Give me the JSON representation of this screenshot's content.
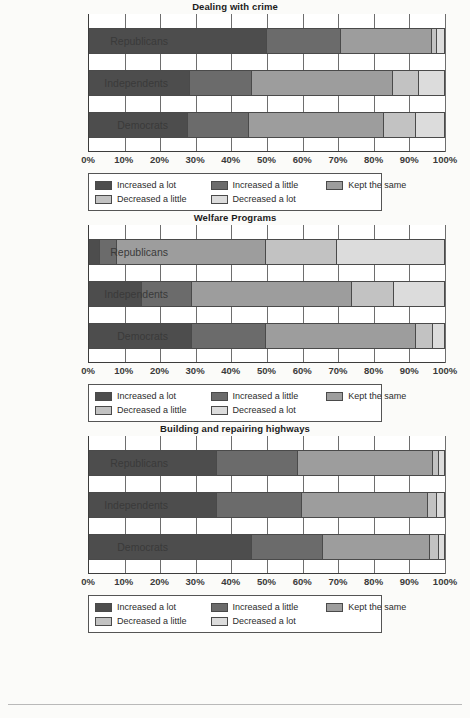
{
  "chart_data": [
    {
      "type": "bar",
      "subtype": "stacked-horizontal-100pct",
      "title": "Dealing with crime",
      "xlabel": "",
      "ylabel": "",
      "xlim": [
        0,
        100
      ],
      "xticks": [
        "0%",
        "10%",
        "20%",
        "30%",
        "40%",
        "50%",
        "60%",
        "70%",
        "80%",
        "90%",
        "100%"
      ],
      "grid": true,
      "legend_position": "bottom",
      "categories": [
        "Republicans",
        "Independents",
        "Democrats"
      ],
      "series": [
        {
          "name": "Increased a lot",
          "color": "#4d4d4d",
          "values": [
            50.0,
            28.5,
            28.0
          ]
        },
        {
          "name": "Increased a little",
          "color": "#6b6b6b",
          "values": [
            21.0,
            17.5,
            17.0
          ]
        },
        {
          "name": "Kept the same",
          "color": "#9d9d9d",
          "values": [
            25.5,
            39.5,
            38.0
          ]
        },
        {
          "name": "Decreased a little",
          "color": "#c2c2c2",
          "values": [
            1.5,
            7.5,
            9.0
          ]
        },
        {
          "name": "Decreased a lot",
          "color": "#dcdcdc",
          "values": [
            2.0,
            7.0,
            8.0
          ]
        }
      ]
    },
    {
      "type": "bar",
      "subtype": "stacked-horizontal-100pct",
      "title": "Welfare Programs",
      "xlabel": "",
      "ylabel": "",
      "xlim": [
        0,
        100
      ],
      "xticks": [
        "0%",
        "10%",
        "20%",
        "30%",
        "40%",
        "50%",
        "60%",
        "70%",
        "80%",
        "90%",
        "100%"
      ],
      "grid": true,
      "legend_position": "bottom",
      "categories": [
        "Republicans",
        "Independents",
        "Democrats"
      ],
      "series": [
        {
          "name": "Increased a lot",
          "color": "#4d4d4d",
          "values": [
            3.0,
            15.0,
            29.0
          ]
        },
        {
          "name": "Increased a little",
          "color": "#6b6b6b",
          "values": [
            5.0,
            14.0,
            21.0
          ]
        },
        {
          "name": "Kept the same",
          "color": "#9d9d9d",
          "values": [
            42.0,
            45.0,
            42.0
          ]
        },
        {
          "name": "Decreased a little",
          "color": "#c2c2c2",
          "values": [
            20.0,
            12.0,
            5.0
          ]
        },
        {
          "name": "Decreased a lot",
          "color": "#dcdcdc",
          "values": [
            30.0,
            14.0,
            3.0
          ]
        }
      ]
    },
    {
      "type": "bar",
      "subtype": "stacked-horizontal-100pct",
      "title": "Building and repairing highways",
      "xlabel": "",
      "ylabel": "",
      "xlim": [
        0,
        100
      ],
      "xticks": [
        "0%",
        "10%",
        "20%",
        "30%",
        "40%",
        "50%",
        "60%",
        "70%",
        "80%",
        "90%",
        "100%"
      ],
      "grid": true,
      "legend_position": "bottom",
      "categories": [
        "Republicans",
        "Independents",
        "Democrats"
      ],
      "series": [
        {
          "name": "Increased a lot",
          "color": "#4d4d4d",
          "values": [
            36.0,
            36.0,
            46.0
          ]
        },
        {
          "name": "Increased a little",
          "color": "#6b6b6b",
          "values": [
            23.0,
            24.0,
            20.0
          ]
        },
        {
          "name": "Kept the same",
          "color": "#9d9d9d",
          "values": [
            38.0,
            35.5,
            30.0
          ]
        },
        {
          "name": "Decreased a little",
          "color": "#c2c2c2",
          "values": [
            1.5,
            2.5,
            2.5
          ]
        },
        {
          "name": "Decreased a lot",
          "color": "#dcdcdc",
          "values": [
            1.5,
            2.0,
            1.5
          ]
        }
      ]
    }
  ],
  "legend": {
    "items": [
      {
        "label": "Increased a lot",
        "color": "#4d4d4d"
      },
      {
        "label": "Increased a little",
        "color": "#6b6b6b"
      },
      {
        "label": "Kept the same",
        "color": "#9d9d9d"
      },
      {
        "label": "Decreased a little",
        "color": "#c2c2c2"
      },
      {
        "label": "Decreased a lot",
        "color": "#dcdcdc"
      }
    ]
  }
}
